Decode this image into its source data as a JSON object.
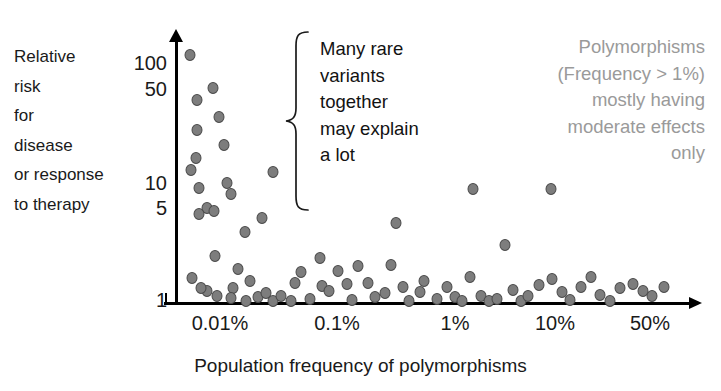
{
  "figure": {
    "width": 721,
    "height": 391,
    "background": "#ffffff",
    "marker_fill": "#7d7d7d",
    "marker_stroke": "#4a4a4a",
    "axis_color": "#000000",
    "gray_text_color": "#9a9a9a"
  },
  "y_axis_caption_lines": [
    "Relative",
    "risk",
    "for",
    "disease",
    "or response",
    "to therapy"
  ],
  "annotation_lines": [
    "Many rare",
    "variants",
    "together",
    "may explain",
    "a lot"
  ],
  "gray_note_lines": [
    "Polymorphisms",
    "(Frequency > 1%)",
    "mostly having",
    "moderate effects",
    "only"
  ],
  "chart_data": {
    "type": "scatter",
    "title": "",
    "xlabel": "Population frequency of polymorphisms",
    "ylabel": "Relative risk for disease or response to therapy",
    "xscale": "log",
    "yscale": "log",
    "grid": false,
    "legend": "none",
    "xtick_labels": [
      "0.01%",
      "0.1%",
      "1%",
      "10%",
      "50%"
    ],
    "xtick_values": [
      0.01,
      0.1,
      1,
      10,
      50
    ],
    "xtick_px": [
      220,
      337,
      455,
      555,
      650
    ],
    "ytick_labels": [
      "100",
      "50",
      "10",
      "5",
      "1"
    ],
    "ytick_values": [
      100,
      50,
      10,
      5,
      1
    ],
    "ytick_px": [
      63,
      89,
      183,
      208,
      300
    ],
    "xlim": [
      0.004,
      80
    ],
    "ylim": [
      1,
      130
    ],
    "n_points": 78,
    "points_px": [
      [
        190,
        55
      ],
      [
        213,
        88
      ],
      [
        197,
        100
      ],
      [
        219,
        117
      ],
      [
        197,
        130
      ],
      [
        224,
        145
      ],
      [
        196,
        158
      ],
      [
        191,
        170
      ],
      [
        227,
        183
      ],
      [
        199,
        188
      ],
      [
        231,
        194
      ],
      [
        207,
        208
      ],
      [
        199,
        214
      ],
      [
        214,
        211
      ],
      [
        273,
        172
      ],
      [
        262,
        218
      ],
      [
        192,
        278
      ],
      [
        215,
        256
      ],
      [
        245,
        232
      ],
      [
        207,
        291
      ],
      [
        217,
        296
      ],
      [
        201,
        288
      ],
      [
        233,
        288
      ],
      [
        250,
        281
      ],
      [
        238,
        269
      ],
      [
        231,
        298
      ],
      [
        246,
        301
      ],
      [
        258,
        297
      ],
      [
        266,
        293
      ],
      [
        273,
        301
      ],
      [
        281,
        296
      ],
      [
        291,
        301
      ],
      [
        301,
        272
      ],
      [
        295,
        283
      ],
      [
        310,
        299
      ],
      [
        322,
        286
      ],
      [
        329,
        291
      ],
      [
        320,
        258
      ],
      [
        338,
        271
      ],
      [
        347,
        284
      ],
      [
        352,
        300
      ],
      [
        358,
        266
      ],
      [
        368,
        283
      ],
      [
        375,
        297
      ],
      [
        385,
        293
      ],
      [
        396,
        223
      ],
      [
        391,
        265
      ],
      [
        403,
        287
      ],
      [
        409,
        301
      ],
      [
        420,
        292
      ],
      [
        424,
        281
      ],
      [
        437,
        299
      ],
      [
        447,
        287
      ],
      [
        455,
        297
      ],
      [
        462,
        301
      ],
      [
        473,
        189
      ],
      [
        470,
        277
      ],
      [
        481,
        296
      ],
      [
        489,
        301
      ],
      [
        497,
        299
      ],
      [
        505,
        245
      ],
      [
        513,
        290
      ],
      [
        521,
        301
      ],
      [
        528,
        296
      ],
      [
        539,
        285
      ],
      [
        551,
        189
      ],
      [
        552,
        279
      ],
      [
        562,
        292
      ],
      [
        570,
        300
      ],
      [
        581,
        287
      ],
      [
        591,
        277
      ],
      [
        600,
        295
      ],
      [
        610,
        301
      ],
      [
        620,
        288
      ],
      [
        633,
        284
      ],
      [
        643,
        291
      ],
      [
        652,
        296
      ],
      [
        664,
        287
      ]
    ]
  }
}
